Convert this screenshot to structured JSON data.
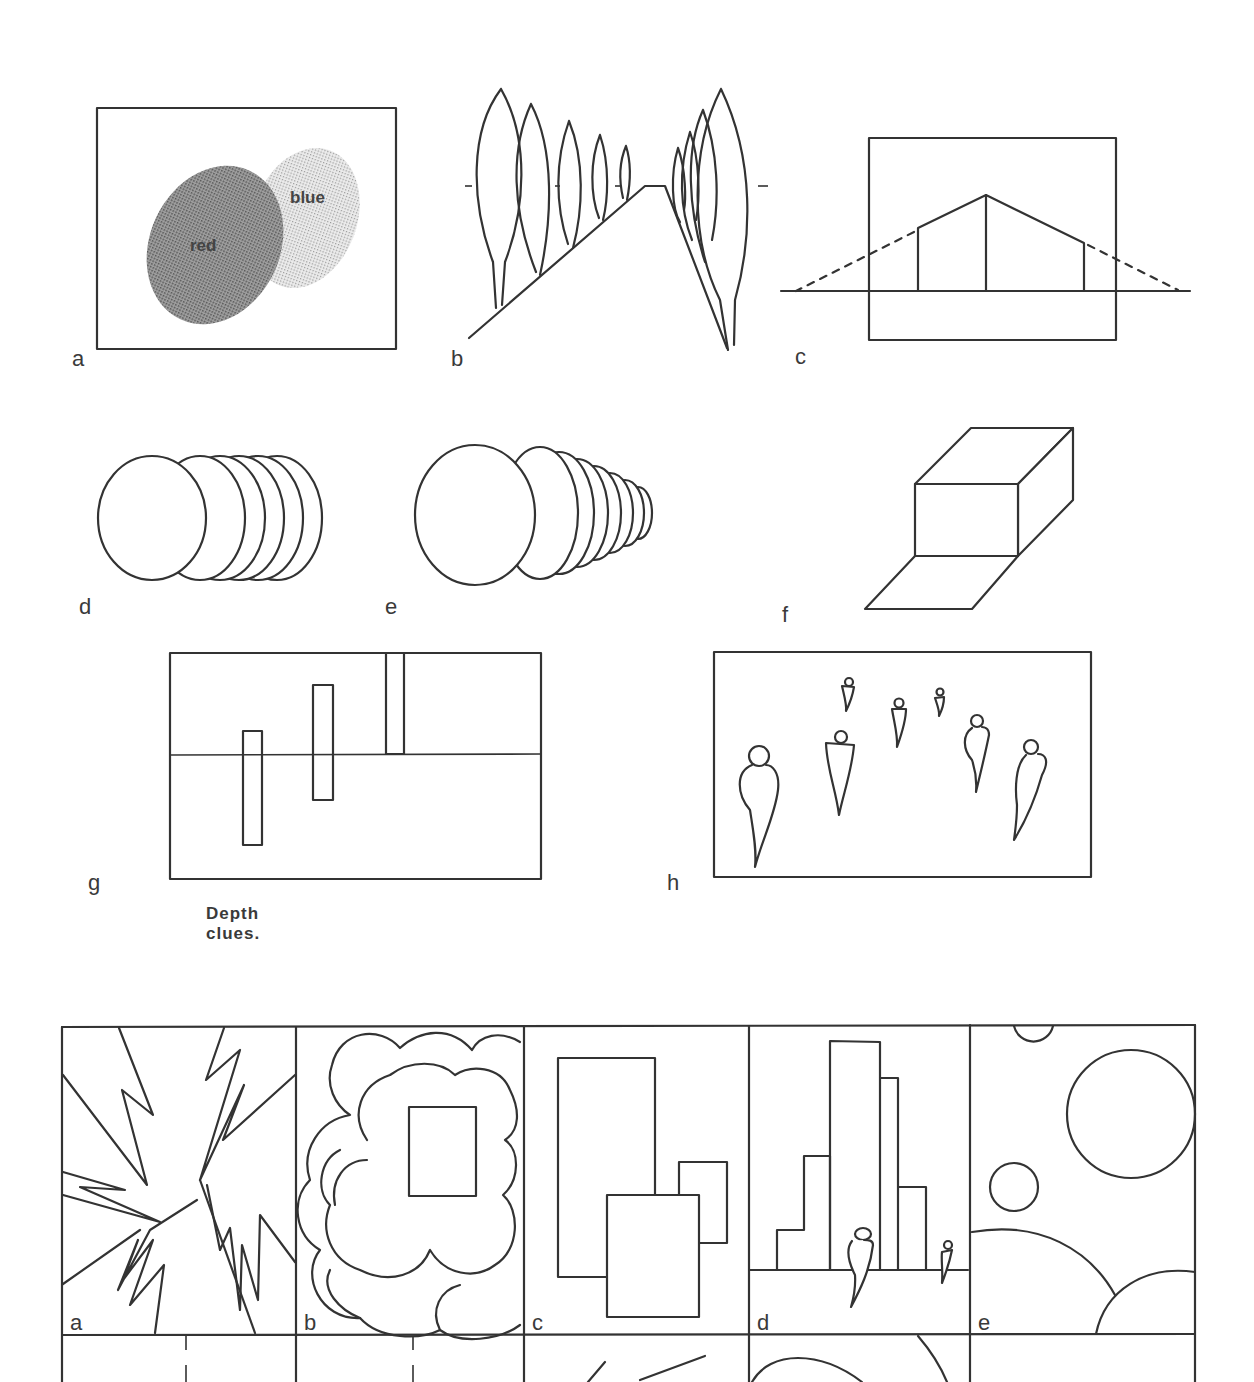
{
  "page": {
    "caption": "Depth clues.",
    "colors": {
      "ink": "#333333",
      "paper": "#ffffff",
      "dark_screen": "#7a7a7a",
      "light_screen": "#cfcfcf"
    }
  },
  "figures_top": [
    {
      "id": "a",
      "label": "a",
      "description": "overlapping colour areas",
      "text_red": "red",
      "text_blue": "blue"
    },
    {
      "id": "b",
      "label": "b",
      "description": "avenue of trees converging to horizon"
    },
    {
      "id": "c",
      "label": "c",
      "description": "house with two-point perspective lines"
    },
    {
      "id": "d",
      "label": "d",
      "description": "stack of equal discs"
    },
    {
      "id": "e",
      "label": "e",
      "description": "stack of diminishing discs"
    },
    {
      "id": "f",
      "label": "f",
      "description": "box with shaded shadow plane"
    },
    {
      "id": "g",
      "label": "g",
      "description": "three bars at different heights relative to horizon"
    },
    {
      "id": "h",
      "label": "h",
      "description": "figures of decreasing size"
    }
  ],
  "grid_bottom": {
    "row1": [
      {
        "id": "a",
        "label": "a",
        "description": "jagged burst shapes"
      },
      {
        "id": "b",
        "label": "b",
        "description": "cloud shapes with shaded rectangle"
      },
      {
        "id": "c",
        "label": "c",
        "description": "overlapping rectangles"
      },
      {
        "id": "d",
        "label": "d",
        "description": "stepped buildings with figures"
      },
      {
        "id": "e",
        "label": "e",
        "description": "circles of various sizes"
      }
    ]
  }
}
